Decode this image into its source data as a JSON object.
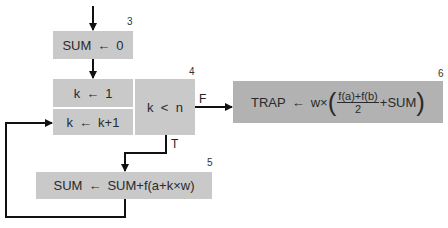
{
  "diagram": {
    "type": "flowchart",
    "nodes": [
      {
        "id": "3",
        "label_num": "3",
        "lhs": "SUM",
        "arrow": "←",
        "rhs": "0"
      },
      {
        "id": "4a",
        "lhs": "k",
        "arrow": "←",
        "rhs": "1"
      },
      {
        "id": "4b",
        "lhs": "k",
        "arrow": "←",
        "rhs": "k+1"
      },
      {
        "id": "4c",
        "label_num": "4",
        "text": "k  <  n"
      },
      {
        "id": "5",
        "label_num": "5",
        "lhs": "SUM",
        "arrow": "←",
        "rhs": "SUM+f(a+k×w)"
      },
      {
        "id": "6",
        "label_num": "6",
        "lhs": "TRAP",
        "arrow": "←",
        "rhs_prefix": "w×",
        "frac_num": "f(a)+f(b)",
        "frac_den": "2",
        "rhs_suffix": "+SUM",
        "lparen": "(",
        "rparen": ")"
      }
    ],
    "edges": [
      {
        "from": "start",
        "to": "3"
      },
      {
        "from": "3",
        "to": "4a"
      },
      {
        "from": "4c",
        "to": "6",
        "label": "F"
      },
      {
        "from": "4c",
        "to": "5",
        "label": "T"
      },
      {
        "from": "5",
        "to": "4b"
      }
    ],
    "branch_labels": {
      "false": "F",
      "true": "T"
    },
    "colors": {
      "box": "#c9c9c9",
      "box_dark": "#b2b2b2",
      "line": "#111111"
    }
  }
}
